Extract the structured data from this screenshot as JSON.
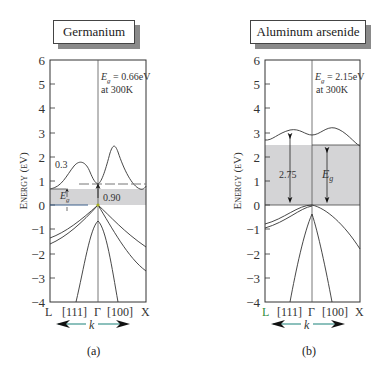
{
  "panels": [
    {
      "id": "a",
      "title": "Germanium",
      "caption": "(a)",
      "gap_label_main": "E",
      "gap_label_sub": "g",
      "gap_value": " = 0.66eV",
      "temperature": "at 300K",
      "annotations": [
        "0.3",
        "0.90"
      ],
      "eg_label": "E",
      "eg_sub": "g"
    },
    {
      "id": "b",
      "title": "Aluminum arsenide",
      "caption": "(b)",
      "gap_label_main": "E",
      "gap_label_sub": "g",
      "gap_value": " = 2.15eV",
      "temperature": "at 300K",
      "annotations": [
        "2.75"
      ],
      "eg_label": "E",
      "eg_sub": "g"
    }
  ],
  "axes": {
    "ylabel": "Energy (eV)",
    "yticks": [
      "6",
      "5",
      "4",
      "3",
      "2",
      "1",
      "0",
      "−1",
      "−2",
      "−3",
      "−4"
    ],
    "xticks": [
      "L",
      "[111]",
      "Γ",
      "[100]",
      "X"
    ],
    "k_label": "k"
  },
  "colors": {
    "gap_fill": "#d4d4d6",
    "k_arrow_line": "#2f8c86",
    "blue_line": "#3a5f8a",
    "axis": "#333333"
  }
}
